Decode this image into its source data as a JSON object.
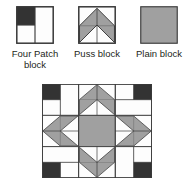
{
  "figure": {
    "colors": {
      "dark": "#333333",
      "gray": "#a0a0a0",
      "light": "#fdfdfd",
      "outline": "#3a3a3a",
      "text": "#231f20",
      "background": "#ffffff"
    }
  },
  "legend": {
    "items": [
      {
        "key": "four-patch",
        "label": "Four Patch\nblock",
        "swatch_name": "four-patch-block-swatch",
        "fill": "#333333"
      },
      {
        "key": "puss",
        "label": "Puss block",
        "swatch_name": "puss-block-swatch",
        "fill": "#a0a0a0"
      },
      {
        "key": "plain",
        "label": "Plain block",
        "swatch_name": "plain-block-swatch",
        "fill": "#a0a0a0"
      }
    ]
  },
  "quilt": {
    "name": "quilt-layout-diagram",
    "rows": 3,
    "cols": 3,
    "cells": [
      {
        "row": 0,
        "col": 0,
        "block": "four-patch",
        "rotation": 0,
        "name": "quilt-cell-top-left"
      },
      {
        "row": 0,
        "col": 1,
        "block": "puss",
        "rotation": 0,
        "name": "quilt-cell-top-center"
      },
      {
        "row": 0,
        "col": 2,
        "block": "four-patch",
        "rotation": 90,
        "name": "quilt-cell-top-right"
      },
      {
        "row": 1,
        "col": 0,
        "block": "puss",
        "rotation": 270,
        "name": "quilt-cell-middle-left"
      },
      {
        "row": 1,
        "col": 1,
        "block": "plain",
        "rotation": 0,
        "name": "quilt-cell-center"
      },
      {
        "row": 1,
        "col": 2,
        "block": "puss",
        "rotation": 90,
        "name": "quilt-cell-middle-right"
      },
      {
        "row": 2,
        "col": 0,
        "block": "four-patch",
        "rotation": 270,
        "name": "quilt-cell-bottom-left"
      },
      {
        "row": 2,
        "col": 1,
        "block": "puss",
        "rotation": 180,
        "name": "quilt-cell-bottom-center"
      },
      {
        "row": 2,
        "col": 2,
        "block": "four-patch",
        "rotation": 180,
        "name": "quilt-cell-bottom-right"
      }
    ]
  }
}
